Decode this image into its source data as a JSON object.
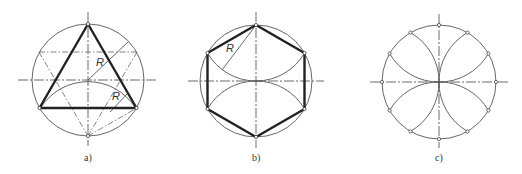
{
  "figure": {
    "panels": [
      {
        "id": "a",
        "caption": "a)",
        "description": "Equilateral triangle inscribed in circle, constructed with radius R arcs",
        "radius_label": "R",
        "radius_label_2": "R"
      },
      {
        "id": "b",
        "caption": "b)",
        "description": "Regular hexagon inscribed in circle, constructed with radius R arcs",
        "radius_label": "R"
      },
      {
        "id": "c",
        "caption": "c)",
        "description": "Circle divided into 12 equal parts using radius arcs from quadrant points"
      }
    ],
    "colors": {
      "line": "#222222",
      "thin": "#555555",
      "background": "#ffffff"
    }
  }
}
